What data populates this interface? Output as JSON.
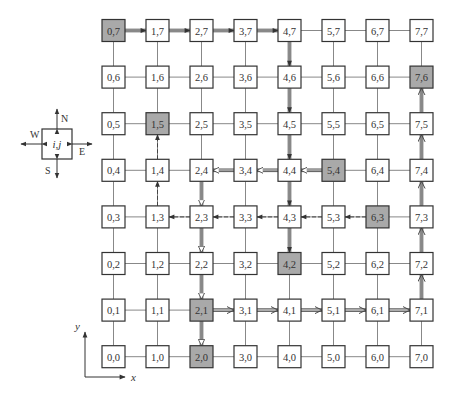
{
  "diagram": {
    "grid": {
      "cols": 8,
      "rows": 8,
      "x0": 113.5,
      "dx": 44,
      "y0": 30.5,
      "dy": 46.6,
      "node_w": 23,
      "node_h": 22
    },
    "colors": {
      "node_fill": "#ffffff",
      "node_shaded": "#a9a9a9",
      "node_border": "#333333",
      "link": "#888888",
      "path": "#444444",
      "text": "#333333"
    },
    "shaded_nodes": [
      "0,7",
      "1,5",
      "7,6",
      "5,4",
      "6,3",
      "4,2",
      "2,1",
      "2,0"
    ],
    "routes": [
      {
        "name": "route-solid-arrow",
        "style": "double-solid-filled-arrow",
        "from": "0,7",
        "to": "4,2",
        "hops": [
          [
            0,
            7
          ],
          [
            1,
            7
          ],
          [
            2,
            7
          ],
          [
            3,
            7
          ],
          [
            4,
            7
          ],
          [
            4,
            6
          ],
          [
            4,
            5
          ],
          [
            4,
            4
          ],
          [
            4,
            3
          ],
          [
            4,
            2
          ]
        ]
      },
      {
        "name": "route-open-triangle",
        "style": "double-open-triangle",
        "from": "5,4",
        "to": "2,0",
        "hops": [
          [
            5,
            4
          ],
          [
            4,
            4
          ],
          [
            3,
            4
          ],
          [
            2,
            4
          ],
          [
            2,
            3
          ],
          [
            2,
            2
          ],
          [
            2,
            1
          ],
          [
            2,
            0
          ]
        ]
      },
      {
        "name": "route-dashed",
        "style": "dashed-filled-arrow",
        "from": "6,3",
        "to": "1,5",
        "hops": [
          [
            6,
            3
          ],
          [
            5,
            3
          ],
          [
            4,
            3
          ],
          [
            3,
            3
          ],
          [
            2,
            3
          ],
          [
            1,
            3
          ],
          [
            1,
            4
          ],
          [
            1,
            5
          ]
        ]
      },
      {
        "name": "route-open-v",
        "style": "double-open-v",
        "from": "2,1",
        "to": "7,6",
        "hops": [
          [
            2,
            1
          ],
          [
            3,
            1
          ],
          [
            4,
            1
          ],
          [
            5,
            1
          ],
          [
            6,
            1
          ],
          [
            7,
            1
          ],
          [
            7,
            2
          ],
          [
            7,
            3
          ],
          [
            7,
            4
          ],
          [
            7,
            5
          ],
          [
            7,
            6
          ]
        ]
      }
    ],
    "legend_node": {
      "label": "i,j",
      "directions": {
        "north": "N",
        "south": "S",
        "east": "E",
        "west": "W"
      }
    },
    "axes": {
      "x_label": "x",
      "y_label": "y"
    }
  }
}
